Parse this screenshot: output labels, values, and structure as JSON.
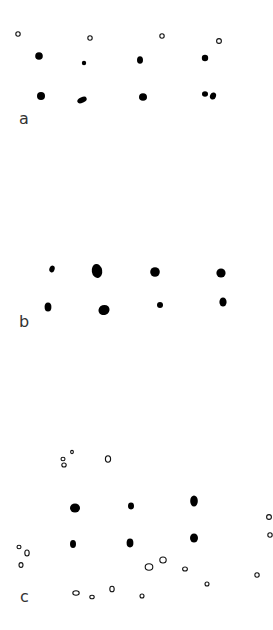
{
  "figure": {
    "colors": {
      "background": "#ffffff",
      "filled": "#000000",
      "open_stroke": "#111111",
      "label": "#333333"
    },
    "panels": [
      {
        "label": "a",
        "label_pos": [
          19,
          111
        ],
        "filled": [
          {
            "x": 39,
            "y": 56,
            "rx": 3.8,
            "ry": 3.8,
            "rot": 0
          },
          {
            "x": 84,
            "y": 63,
            "rx": 2.2,
            "ry": 2.2,
            "rot": 0
          },
          {
            "x": 140,
            "y": 60,
            "rx": 3,
            "ry": 3.8,
            "rot": 0
          },
          {
            "x": 205,
            "y": 58,
            "rx": 3.2,
            "ry": 3.2,
            "rot": 0
          },
          {
            "x": 41,
            "y": 96,
            "rx": 4,
            "ry": 4,
            "rot": 0
          },
          {
            "x": 82,
            "y": 100,
            "rx": 5,
            "ry": 2.8,
            "rot": -25
          },
          {
            "x": 143,
            "y": 97,
            "rx": 4,
            "ry": 3.8,
            "rot": 0
          },
          {
            "x": 205,
            "y": 94,
            "rx": 3,
            "ry": 2.8,
            "rot": 0
          },
          {
            "x": 213,
            "y": 96,
            "rx": 3,
            "ry": 3.6,
            "rot": 20
          }
        ],
        "open": [
          {
            "x": 18,
            "y": 34,
            "rx": 2.2,
            "ry": 2.2
          },
          {
            "x": 90,
            "y": 38,
            "rx": 2.2,
            "ry": 2.2
          },
          {
            "x": 162,
            "y": 36,
            "rx": 2.2,
            "ry": 2.2
          },
          {
            "x": 219,
            "y": 41,
            "rx": 2.4,
            "ry": 2.4
          }
        ]
      },
      {
        "label": "b",
        "label_pos": [
          19,
          314
        ],
        "filled": [
          {
            "x": 52,
            "y": 269,
            "rx": 2.6,
            "ry": 3.4,
            "rot": 20
          },
          {
            "x": 97,
            "y": 271,
            "rx": 5.2,
            "ry": 7,
            "rot": -10
          },
          {
            "x": 155,
            "y": 272,
            "rx": 4.8,
            "ry": 4.8,
            "rot": 0
          },
          {
            "x": 221,
            "y": 273,
            "rx": 4.6,
            "ry": 4.6,
            "rot": 0
          },
          {
            "x": 48,
            "y": 307,
            "rx": 3.4,
            "ry": 4.6,
            "rot": 0
          },
          {
            "x": 104,
            "y": 310,
            "rx": 5.6,
            "ry": 5,
            "rot": -20
          },
          {
            "x": 160,
            "y": 305,
            "rx": 3,
            "ry": 3,
            "rot": 0
          },
          {
            "x": 223,
            "y": 302,
            "rx": 3.6,
            "ry": 4.6,
            "rot": 0
          }
        ],
        "open": []
      },
      {
        "label": "c",
        "label_pos": [
          20,
          589
        ],
        "filled": [
          {
            "x": 75,
            "y": 508,
            "rx": 5,
            "ry": 4.6,
            "rot": 0
          },
          {
            "x": 131,
            "y": 506,
            "rx": 3,
            "ry": 3.4,
            "rot": 0
          },
          {
            "x": 194,
            "y": 501,
            "rx": 3.8,
            "ry": 5.6,
            "rot": 0
          },
          {
            "x": 73,
            "y": 544,
            "rx": 3,
            "ry": 4,
            "rot": 0
          },
          {
            "x": 130,
            "y": 543,
            "rx": 3.4,
            "ry": 4.4,
            "rot": 0
          },
          {
            "x": 194,
            "y": 538,
            "rx": 4,
            "ry": 4.6,
            "rot": 0
          }
        ],
        "open": [
          {
            "x": 64,
            "y": 465,
            "rx": 2.2,
            "ry": 2
          },
          {
            "x": 63,
            "y": 459,
            "rx": 2,
            "ry": 1.8
          },
          {
            "x": 72,
            "y": 452,
            "rx": 1.4,
            "ry": 1.6
          },
          {
            "x": 108,
            "y": 459,
            "rx": 2.6,
            "ry": 3.2
          },
          {
            "x": 19,
            "y": 547,
            "rx": 2,
            "ry": 1.8
          },
          {
            "x": 27,
            "y": 553,
            "rx": 2.2,
            "ry": 3
          },
          {
            "x": 21,
            "y": 565,
            "rx": 2,
            "ry": 2.4
          },
          {
            "x": 149,
            "y": 567,
            "rx": 3.8,
            "ry": 3.2
          },
          {
            "x": 163,
            "y": 560,
            "rx": 3.2,
            "ry": 3
          },
          {
            "x": 185,
            "y": 569,
            "rx": 2.4,
            "ry": 2
          },
          {
            "x": 207,
            "y": 584,
            "rx": 2,
            "ry": 2
          },
          {
            "x": 257,
            "y": 575,
            "rx": 2.2,
            "ry": 2.2
          },
          {
            "x": 269,
            "y": 517,
            "rx": 2.4,
            "ry": 2.4
          },
          {
            "x": 270,
            "y": 535,
            "rx": 2.2,
            "ry": 2.2
          },
          {
            "x": 76,
            "y": 593,
            "rx": 3.2,
            "ry": 2.2
          },
          {
            "x": 92,
            "y": 597,
            "rx": 2.2,
            "ry": 1.8
          },
          {
            "x": 112,
            "y": 589,
            "rx": 2.2,
            "ry": 2.8
          },
          {
            "x": 142,
            "y": 596,
            "rx": 2,
            "ry": 2
          }
        ]
      }
    ]
  }
}
